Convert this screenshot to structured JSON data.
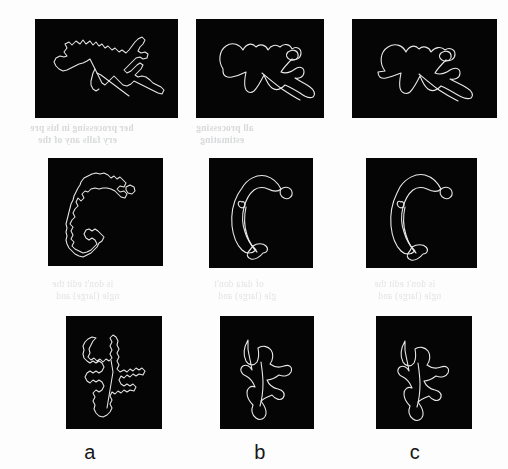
{
  "figure": {
    "background_color": "#fdfdfd",
    "panel_color": "#050505",
    "curve_color": "#e8e8e6",
    "columns": [
      {
        "key": "a",
        "label": "a"
      },
      {
        "key": "b",
        "label": "b"
      },
      {
        "key": "c",
        "label": "c"
      }
    ],
    "rows": [
      {
        "key": "row1",
        "name": "branched-contour"
      },
      {
        "key": "row2",
        "name": "crescent-contour"
      },
      {
        "key": "row3",
        "name": "tree-contour"
      }
    ],
    "panels": [
      {
        "id": "panel-1a",
        "row": 1,
        "column": "a",
        "style": "rough",
        "shape": "branched-contour"
      },
      {
        "id": "panel-1b",
        "row": 1,
        "column": "b",
        "style": "smooth",
        "shape": "branched-contour"
      },
      {
        "id": "panel-1c",
        "row": 1,
        "column": "c",
        "style": "smooth",
        "shape": "branched-contour"
      },
      {
        "id": "panel-2a",
        "row": 2,
        "column": "a",
        "style": "rough",
        "shape": "crescent-contour"
      },
      {
        "id": "panel-2b",
        "row": 2,
        "column": "b",
        "style": "smooth",
        "shape": "crescent-contour"
      },
      {
        "id": "panel-2c",
        "row": 2,
        "column": "c",
        "style": "smooth",
        "shape": "crescent-contour"
      },
      {
        "id": "panel-3a",
        "row": 3,
        "column": "a",
        "style": "rough",
        "shape": "tree-contour"
      },
      {
        "id": "panel-3b",
        "row": 3,
        "column": "b",
        "style": "smooth",
        "shape": "tree-contour"
      },
      {
        "id": "panel-3c",
        "row": 3,
        "column": "c",
        "style": "smooth",
        "shape": "tree-contour"
      }
    ]
  },
  "showthrough": {
    "note": "faint mirrored text bleeding through from the reverse page",
    "lines": [
      "her processing in his pre",
      "ery falls any of the",
      "all processing",
      "estimating",
      "is don't edit the",
      "ngle (large) and",
      "of data don't",
      "gle (large) and"
    ]
  }
}
